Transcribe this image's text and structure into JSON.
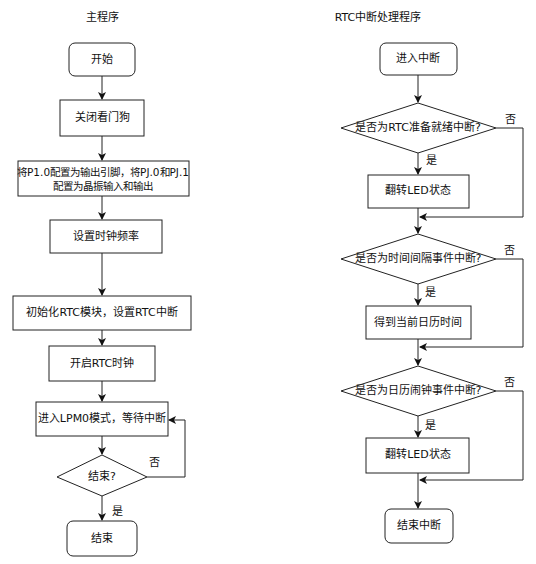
{
  "main": {
    "title": "主程序",
    "nodes": {
      "start": "开始",
      "disable_watchdog": "关闭看门狗",
      "config_pins_line1": "将P1.0配置为输出引脚，将PJ.0和PJ.1",
      "config_pins_line2": "配置为晶振输入和输出",
      "set_clock": "设置时钟频率",
      "init_rtc": "初始化RTC模块，设置RTC中断",
      "start_rtc": "开启RTC时钟",
      "enter_lpm0": "进入LPM0模式，等待中断",
      "decision_end": "结束?",
      "end": "结束"
    },
    "edges": {
      "yes": "是",
      "no": "否"
    }
  },
  "isr": {
    "title": "RTC中断处理程序",
    "nodes": {
      "enter": "进入中断",
      "decision_ready": "是否为RTC准备就绪中断?",
      "toggle_led_1": "翻转LED状态",
      "decision_interval": "是否为时间间隔事件中断?",
      "get_calendar": "得到当前日历时间",
      "decision_alarm": "是否为日历闹钟事件中断?",
      "toggle_led_2": "翻转LED状态",
      "exit": "结束中断"
    },
    "edges": {
      "yes_1": "是",
      "no_1": "否",
      "yes_2": "是",
      "no_2": "否",
      "yes_3": "是",
      "no_3": "否"
    }
  },
  "colors": {
    "stroke": "#222222",
    "background": "#ffffff"
  }
}
